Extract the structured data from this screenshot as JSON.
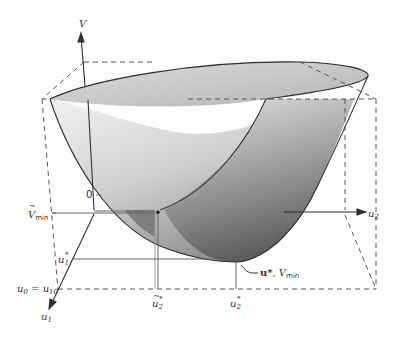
{
  "diagram": {
    "type": "3d-quadratic-surface",
    "axes": {
      "vertical": "V",
      "depth": "u₁",
      "horizontal": "u₂"
    },
    "labels": {
      "axis_V": "V",
      "axis_u2": "u",
      "axis_u2_sub": "2",
      "axis_u1": "u",
      "axis_u1_sub": "1",
      "zero_tick": "0",
      "v_min_tilde": "V",
      "v_min_tilde_sub": "min",
      "u1_star": "u",
      "u1_star_sub": "1",
      "u1_star_sup": "*",
      "u0_eq": "u",
      "u0_eq_sub": "0",
      "u0_eq_mid": " = u",
      "u0_eq_sub2": "10",
      "u2_tilde_star": "u",
      "u2_tilde_star_sub": "2",
      "u2_tilde_star_sup": "*",
      "u2_star": "u",
      "u2_star_sub": "2",
      "u2_star_sup": "*",
      "optimum_bold": "u*",
      "optimum_sep": ", ",
      "optimum_V": "V",
      "optimum_V_sub": "min"
    },
    "colors": {
      "surface_light": "#e8e8e8",
      "surface_mid": "#bdbdbd",
      "surface_dark": "#777777",
      "line": "#333333",
      "dash": "#555555",
      "guide": "#666666"
    }
  }
}
